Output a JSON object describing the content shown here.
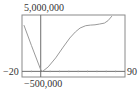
{
  "chart_data": {
    "type": "line",
    "title": "",
    "xlabel": "",
    "ylabel": "",
    "xlim": [
      -20,
      90
    ],
    "ylim": [
      -500000,
      5000000
    ],
    "grid": false,
    "legend": null,
    "tick_labels": {
      "xmin": "−20",
      "xmax": "90",
      "ymin": "−500,000",
      "ymax": "5,000,000"
    },
    "series": [
      {
        "name": "curve",
        "x": [
          -18,
          -10,
          0,
          2,
          8,
          16,
          24,
          31,
          37,
          42,
          48,
          53,
          58,
          63,
          68,
          72,
          76
        ],
        "y": [
          4100000,
          2300000,
          150000,
          0,
          400000,
          1190000,
          2150000,
          2960000,
          3500000,
          3850000,
          4050000,
          4100000,
          4130000,
          4200000,
          4280000,
          4500000,
          4900000
        ]
      }
    ]
  },
  "colors": {
    "curve": "#9a9a9a",
    "axes": "#6e6e6e",
    "frame": "#8a8a8a"
  }
}
